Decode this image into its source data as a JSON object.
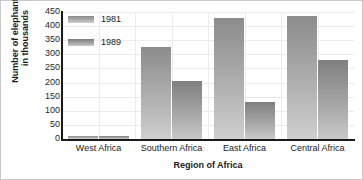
{
  "chart_data": {
    "type": "bar",
    "title": "",
    "xlabel": "Region of Africa",
    "ylabel_line1": "Number of elephants",
    "ylabel_line2": "in thousands",
    "categories": [
      "West Africa",
      "Southern Africa",
      "East Africa",
      "Central Africa"
    ],
    "series": [
      {
        "name": "1981",
        "values": [
          10,
          325,
          430,
          435
        ]
      },
      {
        "name": "1989",
        "values": [
          10,
          205,
          130,
          280
        ]
      }
    ],
    "ylim": [
      0,
      450
    ],
    "yticks": [
      0,
      50,
      100,
      150,
      200,
      250,
      300,
      350,
      400,
      450
    ],
    "ytick_labels": [
      "0",
      "50",
      "100",
      "150",
      "200",
      "250",
      "300",
      "350",
      "400",
      "450"
    ],
    "grid": true,
    "legend_position": "upper-left-inside",
    "colors": {
      "series_1981": "#a5a5a5",
      "series_1989": "#9b9b9b",
      "axis": "#1a1a1a",
      "grid": "#ececec",
      "background": "#ffffff"
    }
  },
  "legend": {
    "entries": [
      {
        "label": "1981"
      },
      {
        "label": "1989"
      }
    ]
  }
}
